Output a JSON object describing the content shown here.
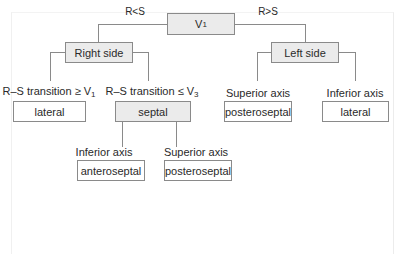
{
  "diagram": {
    "root": {
      "label": "V",
      "subscript": "1"
    },
    "edges": {
      "left": "R<S",
      "right": "R>S"
    },
    "right_side": {
      "label": "Right side",
      "branches": [
        {
          "condition": "R–S transition ≥ V",
          "condition_sub": "1",
          "result": "lateral"
        },
        {
          "condition": "R–S transition ≤ V",
          "condition_sub": "3",
          "result": "septal",
          "branches": [
            {
              "condition": "Inferior axis",
              "result": "anteroseptal"
            },
            {
              "condition": "Superior axis",
              "result": "posteroseptal"
            }
          ]
        }
      ]
    },
    "left_side": {
      "label": "Left side",
      "branches": [
        {
          "condition": "Superior axis",
          "result": "posteroseptal"
        },
        {
          "condition": "Inferior axis",
          "result": "lateral"
        }
      ]
    }
  },
  "colors": {
    "box_border": "#8a8a8a",
    "header_fill": "#ebebeb",
    "text": "#2a2a2a"
  }
}
